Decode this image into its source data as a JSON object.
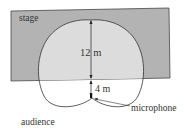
{
  "diagram": {
    "labels": {
      "stage": "stage",
      "distance_top": "12 m",
      "distance_bottom": "4 m",
      "microphone": "microphone",
      "audience": "audience"
    },
    "colors": {
      "stage_fill": "#b3b3b3",
      "pattern_fill": "#d9d9d9",
      "stroke": "#333333",
      "background": "#ffffff"
    }
  }
}
